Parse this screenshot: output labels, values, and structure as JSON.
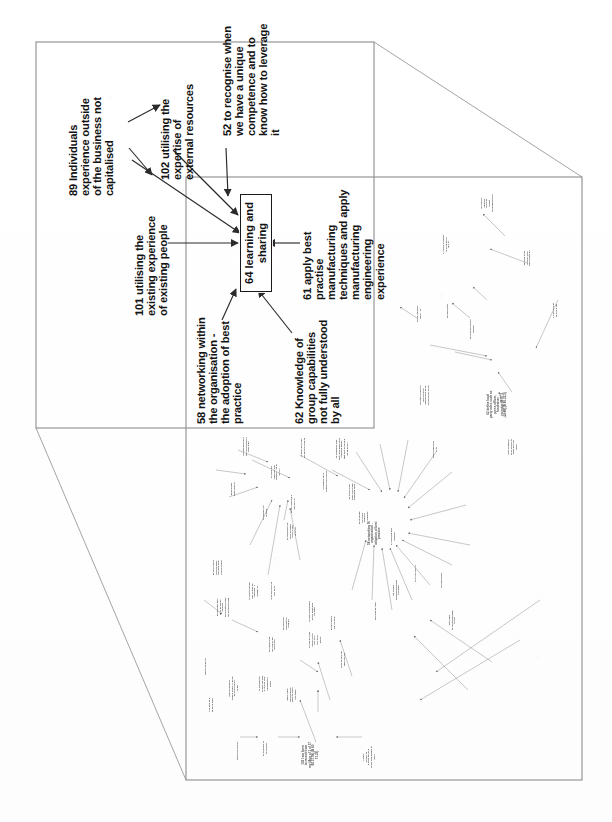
{
  "document": {
    "type": "scanned-causal-map",
    "orientation": "landscape-rotated-90ccw",
    "background_color": "#ffffff",
    "ink_color": "#131313"
  },
  "magnifier": {
    "name": "zoom-callout",
    "detail_frame": {
      "x": 36,
      "y": 42,
      "w": 338,
      "h": 386
    },
    "source_frame": {
      "x": 186,
      "y": 177,
      "w": 396,
      "h": 603
    },
    "connector_top": {
      "x1": 374,
      "y1": 42,
      "x2": 582,
      "y2": 177
    },
    "connector_bottom": {
      "x1": 36,
      "y1": 428,
      "x2": 186,
      "y2": 780
    }
  },
  "detail_map": {
    "title": "learning and sharing cluster",
    "center_node": {
      "id": "64",
      "label": "64 learning and\nsharing",
      "boxed": true
    },
    "nodes": [
      {
        "id": "89",
        "label": "89 Individuals\nexperience outside\nof the business not\ncapitalised"
      },
      {
        "id": "102",
        "label": "102 utilising the\nexpertise of\nexternal resources"
      },
      {
        "id": "52",
        "label": "52 to recognise when\nwe have a unique\ncompetence and to\nknow how to leverage\nit"
      },
      {
        "id": "101",
        "label": "101 utilising the\nexisting experience\nof existing people"
      },
      {
        "id": "61",
        "label": "61 apply best\npractise\nmanufacturing\ntechniques and apply\nmanufacturing\nengineering\nexperience"
      },
      {
        "id": "58",
        "label": "58 networking within\nthe organisation -\nthe adoption of best\npractice"
      },
      {
        "id": "62",
        "label": "62 Knowledge of\ngroup capabilities\nnot fully understood\nby all"
      }
    ],
    "edges": [
      {
        "from": "89",
        "to": "102"
      },
      {
        "from": "89",
        "to": "101"
      },
      {
        "from": "89",
        "to": "64"
      },
      {
        "from": "102",
        "to": "64"
      },
      {
        "from": "52",
        "to": "64"
      },
      {
        "from": "101",
        "to": "64"
      },
      {
        "from": "61",
        "to": "64"
      },
      {
        "from": "58",
        "to": "64"
      },
      {
        "from": "62",
        "to": "64"
      }
    ]
  },
  "source_map": {
    "description": "full causal map, text too small to resolve in scan",
    "legible_fragments": [
      "62 define local\nparty roles such as\npress officer,\nfundraiser,\nrecruiter (B 87,5\n02.99),(B 80.22,5)",
      "105 I am keen\nto recruit from\nmy (Aug of 1 of 17\n66 37.09),(B 60\n71.23)"
    ]
  }
}
